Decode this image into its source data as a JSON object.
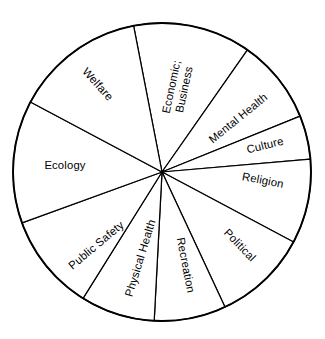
{
  "figure": {
    "name": "quality-of-life-domains-wheel",
    "type": "pie-wheel-diagram",
    "background_color": "#ffffff",
    "stroke_color": "#000000",
    "fill_color": "#ffffff",
    "center_x": 162,
    "center_y": 172,
    "radius": 149
  },
  "chart_data": {
    "type": "pie",
    "title": "",
    "subtitle": "",
    "xlabel": "",
    "ylabel": "",
    "legend_position": "none",
    "grid": false,
    "labels_placement": "inside-radial",
    "start_angle_deg": -11,
    "direction": "clockwise",
    "categories": [
      "Economic; Business",
      "Mental Health",
      "Culture",
      "Religion",
      "Political",
      "Recreation",
      "Physical Health",
      "Public Safety",
      "Ecology",
      "Welfare"
    ],
    "values": [
      46,
      33,
      17,
      33,
      37,
      28,
      29,
      38,
      48,
      51
    ],
    "value_unit": "degrees",
    "total_degrees": 360,
    "slices": [
      {
        "label": "Economic; Business",
        "label_lines": [
          "Economic;",
          "Business"
        ],
        "start_deg": -11,
        "end_deg": 35,
        "span_deg": 46,
        "value": 46
      },
      {
        "label": "Mental Health",
        "label_lines": [
          "Mental Health"
        ],
        "start_deg": 35,
        "end_deg": 68,
        "span_deg": 33,
        "value": 33
      },
      {
        "label": "Culture",
        "label_lines": [
          "Culture"
        ],
        "start_deg": 68,
        "end_deg": 85,
        "span_deg": 17,
        "value": 17
      },
      {
        "label": "Religion",
        "label_lines": [
          "Religion"
        ],
        "start_deg": 85,
        "end_deg": 118,
        "span_deg": 33,
        "value": 33
      },
      {
        "label": "Political",
        "label_lines": [
          "Political"
        ],
        "start_deg": 118,
        "end_deg": 155,
        "span_deg": 37,
        "value": 37
      },
      {
        "label": "Recreation",
        "label_lines": [
          "Recreation"
        ],
        "start_deg": 155,
        "end_deg": 183,
        "span_deg": 28,
        "value": 28
      },
      {
        "label": "Physical Health",
        "label_lines": [
          "Physical Health"
        ],
        "start_deg": 183,
        "end_deg": 212,
        "span_deg": 29,
        "value": 29
      },
      {
        "label": "Public Safety",
        "label_lines": [
          "Public Safety"
        ],
        "start_deg": 212,
        "end_deg": 250,
        "span_deg": 38,
        "value": 38
      },
      {
        "label": "Ecology",
        "label_lines": [
          "Ecology"
        ],
        "start_deg": 250,
        "end_deg": 298,
        "span_deg": 48,
        "value": 48
      },
      {
        "label": "Welfare",
        "label_lines": [
          "Welfare"
        ],
        "start_deg": 298,
        "end_deg": 349,
        "span_deg": 51,
        "value": 51
      }
    ]
  },
  "labels": {
    "economic_business_l1": "Economic;",
    "economic_business_l2": "Business",
    "mental_health": "Mental Health",
    "culture": "Culture",
    "religion": "Religion",
    "political": "Political",
    "recreation": "Recreation",
    "physical_health": "Physical Health",
    "public_safety": "Public Safety",
    "ecology": "Ecology",
    "welfare": "Welfare"
  }
}
